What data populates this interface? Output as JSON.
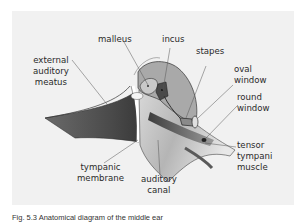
{
  "figure": {
    "type": "anatomical diagram",
    "subject": "middle ear",
    "colors": {
      "background": "#f1f1f1",
      "bone_light": "#b7b7b7",
      "bone_mid": "#9a9a9a",
      "dark": "#4a4a4a",
      "outline": "#3a3a3a",
      "line": "#555555"
    },
    "labels": {
      "external_auditory_meatus": "external\nauditory\nmeatus",
      "malleus": "malleus",
      "incus": "incus",
      "stapes": "stapes",
      "oval_window": "oval\nwindow",
      "round_window": "round\nwindow",
      "tensor_tympani_muscle": "tensor\ntympani\nmuscle",
      "tympanic_membrane": "tympanic\nmembrane",
      "auditory_canal": "auditory\ncanal"
    },
    "caption": "Fig. 5.3  Anatomical diagram of the middle ear"
  }
}
